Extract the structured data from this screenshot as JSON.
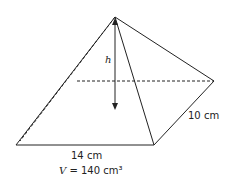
{
  "figure": {
    "type": "rectangular pyramid",
    "labels": {
      "height": "h",
      "width": "10 cm",
      "length": "14 cm",
      "volume_var": "V",
      "volume_value": "= 140 cm³"
    },
    "colors": {
      "stroke": "#222222",
      "background": "#ffffff"
    }
  }
}
